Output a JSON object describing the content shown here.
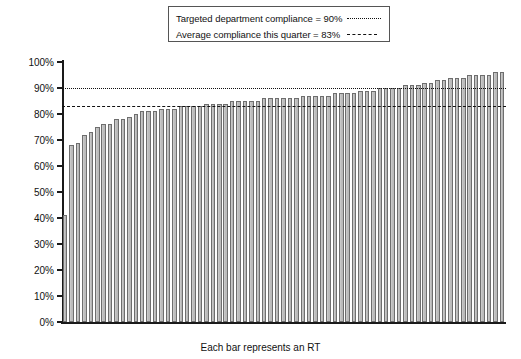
{
  "chart_data": {
    "type": "bar",
    "title": "",
    "xlabel": "Each bar represents an RT",
    "ylabel": "",
    "ylim": [
      0,
      100
    ],
    "grid": false,
    "legend_position": "top-center",
    "ytick_labels": [
      "100%",
      "90%",
      "80%",
      "70%",
      "60%",
      "50%",
      "40%",
      "30%",
      "20%",
      "10%",
      "0%"
    ],
    "ytick_values": [
      100,
      90,
      80,
      70,
      60,
      50,
      40,
      30,
      20,
      10,
      0
    ],
    "categories": [
      "RT 1",
      "RT 2",
      "RT 3",
      "RT 4",
      "RT 5",
      "RT 6",
      "RT 7",
      "RT 8",
      "RT 9",
      "RT 10",
      "RT 11",
      "RT 12",
      "RT 13",
      "RT 14",
      "RT 15",
      "RT 16",
      "RT 17",
      "RT 18",
      "RT 19",
      "RT 20",
      "RT 21",
      "RT 22",
      "RT 23",
      "RT 24",
      "RT 25",
      "RT 26",
      "RT 27",
      "RT 28",
      "RT 29",
      "RT 30",
      "RT 31",
      "RT 32",
      "RT 33",
      "RT 34",
      "RT 35",
      "RT 36",
      "RT 37",
      "RT 38",
      "RT 39",
      "RT 40",
      "RT 41",
      "RT 42",
      "RT 43",
      "RT 44",
      "RT 45",
      "RT 46",
      "RT 47",
      "RT 48",
      "RT 49",
      "RT 50",
      "RT 51",
      "RT 52",
      "RT 53",
      "RT 54",
      "RT 55",
      "RT 56",
      "RT 57",
      "RT 58",
      "RT 59",
      "RT 60",
      "RT 61",
      "RT 62",
      "RT 63",
      "RT 64",
      "RT 65",
      "RT 66",
      "RT 67",
      "RT 68",
      "RT 69"
    ],
    "values": [
      41,
      68,
      69,
      72,
      73,
      75,
      76,
      76,
      78,
      78,
      79,
      80,
      81,
      81,
      81,
      82,
      82,
      82,
      83,
      83,
      83,
      83,
      84,
      84,
      84,
      84,
      85,
      85,
      85,
      85,
      85,
      86,
      86,
      86,
      86,
      86,
      86,
      87,
      87,
      87,
      87,
      87,
      88,
      88,
      88,
      88,
      89,
      89,
      89,
      90,
      90,
      90,
      90,
      91,
      91,
      91,
      92,
      92,
      93,
      93,
      94,
      94,
      94,
      95,
      95,
      95,
      95,
      96,
      96
    ],
    "reference_lines": [
      {
        "label": "Targeted department compliance = 90%",
        "value": 90,
        "style": "dotted"
      },
      {
        "label": "Average compliance this quarter = 83%",
        "value": 83,
        "style": "dashed"
      }
    ],
    "bar_color": "#bcbcbc",
    "bar_border_color": "#6e6e6e",
    "axis_color": "#1a1a1a"
  },
  "legend": {
    "items": [
      {
        "label": "Targeted department compliance = 90%",
        "key": "dotted-line-key"
      },
      {
        "label": "Average compliance this quarter = 83%",
        "key": "dashed-line-key"
      }
    ]
  }
}
